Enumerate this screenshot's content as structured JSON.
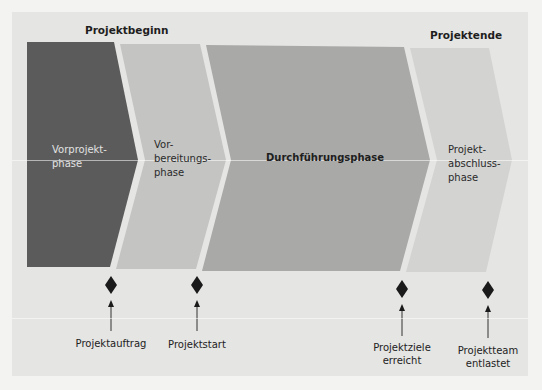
{
  "headers": {
    "start": "Projektbeginn",
    "end": "Projektende"
  },
  "phases": [
    {
      "label_line1": "Vorprojekt-",
      "label_line2": "phase",
      "label_line3": "",
      "color": "#5b5b5b",
      "text_color": "#e2e2e2"
    },
    {
      "label_line1": "Vor-",
      "label_line2": "bereitungs-",
      "label_line3": "phase",
      "color": "#c4c4c2",
      "text_color": "#2a2a2a"
    },
    {
      "label_line1": "Durchführungsphase",
      "label_line2": "",
      "label_line3": "",
      "color": "#a9a9a7",
      "text_color": "#1e1e1e"
    },
    {
      "label_line1": "Projekt-",
      "label_line2": "abschluss-",
      "label_line3": "phase",
      "color": "#d3d3d1",
      "text_color": "#2a2a2a"
    }
  ],
  "milestones": [
    {
      "label_line1": "Projektauftrag",
      "label_line2": ""
    },
    {
      "label_line1": "Projektstart",
      "label_line2": ""
    },
    {
      "label_line1": "Projektziele",
      "label_line2": "erreicht"
    },
    {
      "label_line1": "Projektteam",
      "label_line2": "entlastet"
    }
  ],
  "colors": {
    "page_bg": "#f3f3f1",
    "panel_bg": "#e5e5e3",
    "milestone": "#1a1a1a"
  }
}
